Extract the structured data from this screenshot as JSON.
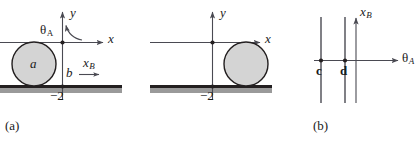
{
  "figure": {
    "background_color": "#ffffff",
    "axis_color": "#4a4a52",
    "ground_color": "#231f20",
    "ground_shadow_color": "#9a9a9a",
    "disk_fill_color": "#d4d4d4",
    "disk_stroke_color": "#231f20",
    "text_color": "#1a1a1a"
  },
  "panels": [
    {
      "id": "a",
      "caption": "(a)",
      "axis_labels": {
        "x": "x",
        "y": "y"
      },
      "annotations": {
        "theta": "θ",
        "theta_sub": "A",
        "disk_label": "a",
        "contact_label": "b",
        "velocity_label": "x",
        "velocity_sub": "B",
        "tick_label": "−2"
      }
    },
    {
      "id": "b",
      "caption": "(b)",
      "axis_labels": {
        "x": "x",
        "y": "y"
      },
      "annotations": {
        "tick_label": "−2"
      }
    },
    {
      "id": "c",
      "caption": "(c)",
      "axis_labels": {
        "horizontal": "θ",
        "horizontal_sub": "A",
        "vertical": "x",
        "vertical_sub": "B"
      },
      "annotations": {
        "line_c_label": "c",
        "line_d_label": "d"
      }
    }
  ]
}
